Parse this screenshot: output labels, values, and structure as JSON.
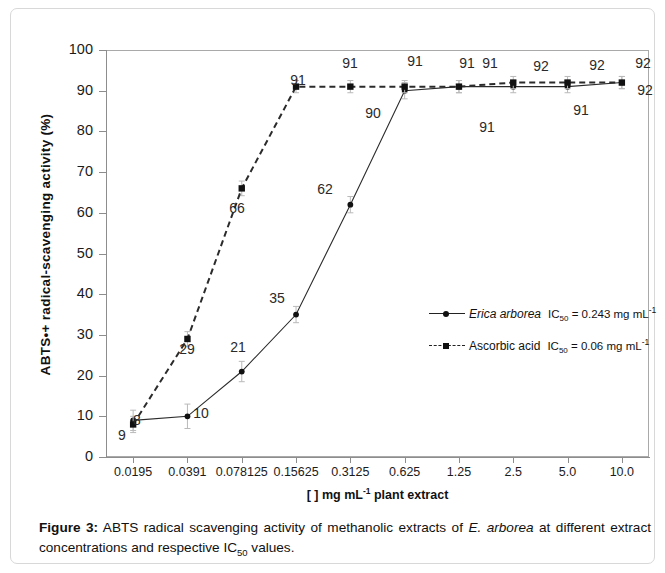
{
  "figure": {
    "caption_label": "Figure 3:",
    "caption_text_1": " ABTS radical scavenging activity of methanolic extracts of ",
    "caption_species_1": "E. arborea",
    "caption_text_2": " at different extract concentrations and respective IC",
    "caption_sub": "50",
    "caption_text_3": " values."
  },
  "legend": {
    "items": [
      {
        "name": "Erica arborea",
        "italic": true,
        "marker": "circle-marker",
        "line": "solid",
        "ic50_prefix": "IC",
        "ic50_sub": "50",
        "ic50_value": " = 0.243 mg mL",
        "ic50_sup": "-1"
      },
      {
        "name": "Ascorbic acid",
        "italic": false,
        "marker": "square-marker",
        "line": "dashed",
        "ic50_prefix": "IC",
        "ic50_sub": "50",
        "ic50_value": " = 0.06 mg mL",
        "ic50_sup": "-1"
      }
    ]
  },
  "axes": {
    "x_title_main": "[ ] mg mL",
    "x_title_sup": "-1",
    "x_title_tail": " plant extract",
    "y_title_a": "ABTS",
    "y_title_radical": "•+",
    "y_title_b": " radical-scavenging activity (%)"
  },
  "chart_data": {
    "type": "line",
    "title": "",
    "xlabel": "[ ] mg mL-1 plant extract",
    "ylabel": "ABTS•+ radical-scavenging activity (%)",
    "categories": [
      "0.0195",
      "0.0391",
      "0.078125",
      "0.15625",
      "0.3125",
      "0.625",
      "1.25",
      "2.5",
      "5.0",
      "10.0"
    ],
    "ylim": [
      0,
      100
    ],
    "ytick_labels": [
      "0",
      "10",
      "20",
      "30",
      "40",
      "50",
      "60",
      "70",
      "80",
      "90",
      "100"
    ],
    "ytick_values": [
      0,
      10,
      20,
      30,
      40,
      50,
      60,
      70,
      80,
      90,
      100
    ],
    "grid": false,
    "legend_position": "inside-right",
    "series": [
      {
        "name": "Erica arborea",
        "style": "solid",
        "marker": "circle",
        "values": [
          9,
          10,
          21,
          35,
          62,
          90,
          91,
          91,
          91,
          92
        ],
        "errors": [
          2.5,
          3.0,
          2.5,
          2.0,
          2.0,
          2.0,
          1.5,
          1.5,
          1.5,
          1.5
        ],
        "labels": [
          "9",
          "10",
          "21",
          "35",
          "62",
          "90",
          "91",
          "91",
          "91",
          "92"
        ]
      },
      {
        "name": "Ascorbic acid",
        "style": "dashed",
        "marker": "square",
        "values": [
          8,
          29,
          66,
          91,
          91,
          91,
          91,
          92,
          92,
          92
        ],
        "errors": [
          2.0,
          1.8,
          1.8,
          1.5,
          1.5,
          1.5,
          1.5,
          1.5,
          1.5,
          1.5
        ],
        "labels": [
          "8",
          "29",
          "66",
          "91",
          "91",
          "91",
          "91",
          "92",
          "92",
          "92"
        ]
      }
    ],
    "point_labels": [
      {
        "text": "9",
        "x": 111,
        "y": 426,
        "series": "Erica arborea"
      },
      {
        "text": "8",
        "x": 126,
        "y": 411,
        "series": "Ascorbic acid"
      },
      {
        "text": "10",
        "x": 190,
        "y": 404,
        "series": "Erica arborea"
      },
      {
        "text": "29",
        "x": 176,
        "y": 340,
        "series": "Ascorbic acid"
      },
      {
        "text": "21",
        "x": 227,
        "y": 338,
        "series": "Erica arborea"
      },
      {
        "text": "66",
        "x": 226,
        "y": 199,
        "series": "Ascorbic acid"
      },
      {
        "text": "35",
        "x": 266,
        "y": 289,
        "series": "Erica arborea"
      },
      {
        "text": "91",
        "x": 287,
        "y": 71,
        "series": "Ascorbic acid"
      },
      {
        "text": "62",
        "x": 314,
        "y": 180,
        "series": "Erica arborea"
      },
      {
        "text": "91",
        "x": 339,
        "y": 54,
        "series": "Ascorbic acid"
      },
      {
        "text": "90",
        "x": 362,
        "y": 104,
        "series": "Erica arborea"
      },
      {
        "text": "91",
        "x": 404,
        "y": 52,
        "series": "Ascorbic acid"
      },
      {
        "text": "91",
        "x": 456,
        "y": 54,
        "series": "Ascorbic acid"
      },
      {
        "text": "91",
        "x": 479,
        "y": 54,
        "series": "Ascorbic acid"
      },
      {
        "text": "91",
        "x": 476,
        "y": 118,
        "series": "Erica arborea"
      },
      {
        "text": "92",
        "x": 530,
        "y": 57,
        "series": "Ascorbic acid"
      },
      {
        "text": "91",
        "x": 570,
        "y": 101,
        "series": "Erica arborea"
      },
      {
        "text": "92",
        "x": 586,
        "y": 56,
        "series": "Ascorbic acid"
      },
      {
        "text": "92",
        "x": 632,
        "y": 54,
        "series": "Ascorbic acid"
      },
      {
        "text": "92",
        "x": 634,
        "y": 81,
        "series": "Erica arborea"
      }
    ]
  }
}
